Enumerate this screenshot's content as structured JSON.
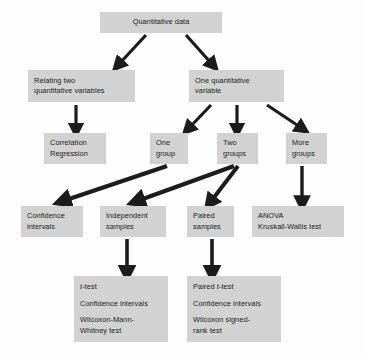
{
  "diagram": {
    "box_fill": "#d2d2d2",
    "arrow_color": "#1c1c1c",
    "background": "#fdfdfd",
    "nodes": [
      {
        "id": "quantitative-data",
        "lines": [
          "Quantitative data"
        ],
        "x": 100,
        "y": 12,
        "w": 122,
        "h": 21,
        "align": "center"
      },
      {
        "id": "relating-two-quantitative-variables",
        "lines": [
          "Relating two",
          "quantitative variables"
        ],
        "x": 28,
        "y": 70,
        "w": 107,
        "h": 32,
        "align": "left"
      },
      {
        "id": "one-quantitative-variable",
        "lines": [
          "One quantitative",
          "variable"
        ],
        "x": 189,
        "y": 70,
        "w": 95,
        "h": 32,
        "align": "left"
      },
      {
        "id": "correlation-regression",
        "lines": [
          "Correlation",
          "Regression"
        ],
        "x": 44,
        "y": 133,
        "w": 62,
        "h": 31,
        "align": "left"
      },
      {
        "id": "one-group",
        "lines": [
          "One",
          "group"
        ],
        "x": 150,
        "y": 133,
        "w": 38,
        "h": 31,
        "align": "left"
      },
      {
        "id": "two-groups",
        "lines": [
          "Two",
          "groups"
        ],
        "x": 217,
        "y": 133,
        "w": 41,
        "h": 31,
        "align": "left"
      },
      {
        "id": "more-groups",
        "lines": [
          "More",
          "groups"
        ],
        "x": 286,
        "y": 133,
        "w": 41,
        "h": 31,
        "align": "left"
      },
      {
        "id": "confidence-intervals-one-group",
        "lines": [
          "Confidence",
          "intervals"
        ],
        "x": 21,
        "y": 206,
        "w": 62,
        "h": 31,
        "align": "left"
      },
      {
        "id": "independent-samples",
        "lines": [
          "Independent",
          "samples"
        ],
        "x": 100,
        "y": 206,
        "w": 66,
        "h": 31,
        "align": "left"
      },
      {
        "id": "paired-samples",
        "lines": [
          "Paired",
          "samples"
        ],
        "x": 187,
        "y": 206,
        "w": 47,
        "h": 31,
        "align": "left"
      },
      {
        "id": "anova-kruskall-wallis",
        "lines": [
          "ANOVA",
          "Kruskall-Wallis test"
        ],
        "x": 252,
        "y": 206,
        "w": 92,
        "h": 31,
        "align": "left"
      }
    ],
    "leaf_nodes": [
      {
        "id": "independent-samples-tests",
        "x": 74,
        "y": 276,
        "w": 94,
        "h": 66,
        "lines": [
          {
            "pre": "",
            "ital": "t",
            "post": "-test"
          },
          {
            "pre": "Confidence intervals",
            "ital": "",
            "post": ""
          },
          {
            "pre": "Wilcoxon-Mann-",
            "ital": "",
            "post": ""
          },
          {
            "pre": "Whitney test",
            "ital": "",
            "post": ""
          }
        ]
      },
      {
        "id": "paired-samples-tests",
        "x": 187,
        "y": 276,
        "w": 94,
        "h": 66,
        "lines": [
          {
            "pre": "Paired ",
            "ital": "t",
            "post": "-test"
          },
          {
            "pre": "Confidence intervals",
            "ital": "",
            "post": ""
          },
          {
            "pre": "Wilcoxon signed-",
            "ital": "",
            "post": ""
          },
          {
            "pre": "rank test",
            "ital": "",
            "post": ""
          }
        ]
      }
    ],
    "edges": [
      {
        "id": "quantitative-data-to-relating-two",
        "from": "quantitative-data",
        "to": "relating-two-quantitative-variables"
      },
      {
        "id": "quantitative-data-to-one-quantitative",
        "from": "quantitative-data",
        "to": "one-quantitative-variable"
      },
      {
        "id": "relating-two-to-correlation",
        "from": "relating-two-quantitative-variables",
        "to": "correlation-regression"
      },
      {
        "id": "one-quantitative-to-one-group",
        "from": "one-quantitative-variable",
        "to": "one-group"
      },
      {
        "id": "one-quantitative-to-two-groups",
        "from": "one-quantitative-variable",
        "to": "two-groups"
      },
      {
        "id": "one-quantitative-to-more-groups",
        "from": "one-quantitative-variable",
        "to": "more-groups"
      },
      {
        "id": "one-group-to-confidence-intervals",
        "from": "one-group",
        "to": "confidence-intervals-one-group"
      },
      {
        "id": "two-groups-to-independent-samples",
        "from": "two-groups",
        "to": "independent-samples"
      },
      {
        "id": "two-groups-to-paired-samples",
        "from": "two-groups",
        "to": "paired-samples"
      },
      {
        "id": "more-groups-to-anova",
        "from": "more-groups",
        "to": "anova-kruskall-wallis"
      },
      {
        "id": "independent-samples-to-tests",
        "from": "independent-samples",
        "to": "independent-samples-tests"
      },
      {
        "id": "paired-samples-to-tests",
        "from": "paired-samples",
        "to": "paired-samples-tests"
      }
    ]
  }
}
